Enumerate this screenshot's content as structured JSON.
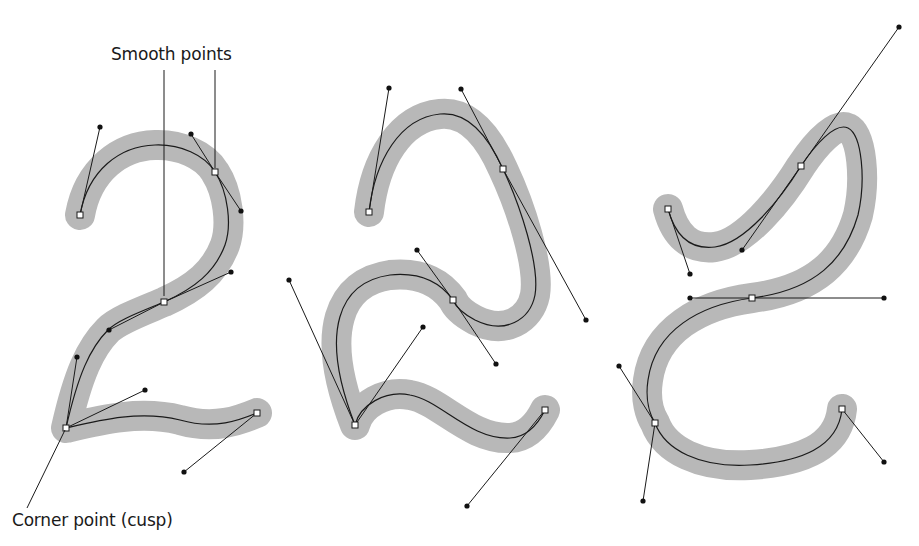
{
  "labels": {
    "smooth": {
      "text": "Smooth points",
      "x": 111,
      "y": 44
    },
    "corner": {
      "text": "Corner point (cusp)",
      "x": 12,
      "y": 510
    }
  },
  "colors": {
    "stroke_band": "#b8b8b8",
    "path": "#1a1a1a",
    "handle": "#111111",
    "anchor_fill": "#ffffff"
  },
  "stroke_band_width": 30,
  "callouts": [
    {
      "name": "smooth-callout-1",
      "x1": 164,
      "y1": 70,
      "x2": 164,
      "y2": 296
    },
    {
      "name": "smooth-callout-2",
      "x1": 215,
      "y1": 70,
      "x2": 215,
      "y2": 168
    },
    {
      "name": "corner-callout",
      "x1": 65,
      "y1": 430,
      "x2": 27,
      "y2": 508
    }
  ],
  "glyphs": [
    {
      "name": "glyph-2-left",
      "path": "M 80 215 C 88 170, 120 146, 155 145 C 180 144, 205 155, 215 172 C 228 192, 232 225, 225 245 C 215 272, 195 288, 164 302 C 140 312, 118 320, 108 330 C 90 348, 78 375, 66 428 C 100 420, 140 410, 180 420 C 215 430, 240 420, 257 413",
      "anchors": [
        {
          "x": 80,
          "y": 215
        },
        {
          "x": 215,
          "y": 172
        },
        {
          "x": 164,
          "y": 302
        },
        {
          "x": 66,
          "y": 428
        },
        {
          "x": 257,
          "y": 413
        }
      ],
      "handles": [
        {
          "ax": 80,
          "ay": 215,
          "hx": 100,
          "hy": 127
        },
        {
          "ax": 215,
          "ay": 172,
          "hx": 191,
          "hy": 134
        },
        {
          "ax": 215,
          "ay": 172,
          "hx": 241,
          "hy": 211
        },
        {
          "ax": 164,
          "ay": 302,
          "hx": 231,
          "hy": 272
        },
        {
          "ax": 164,
          "ay": 302,
          "hx": 109,
          "hy": 330
        },
        {
          "ax": 66,
          "ay": 428,
          "hx": 77,
          "hy": 357
        },
        {
          "ax": 66,
          "ay": 428,
          "hx": 145,
          "hy": 390
        },
        {
          "ax": 257,
          "ay": 413,
          "hx": 184,
          "hy": 472
        }
      ]
    },
    {
      "name": "glyph-2-middle",
      "path": "M 369 212 C 375 160, 400 118, 440 114 C 470 111, 490 140, 503 169 C 520 205, 540 265, 535 295 C 530 320, 505 335, 475 320 C 460 312, 455 305, 453 300 C 440 282, 420 272, 390 275 C 340 282, 318 330, 355 425 C 360 405, 385 390, 410 395 C 440 400, 470 440, 510 438 C 530 437, 540 420, 545 410",
      "anchors": [
        {
          "x": 369,
          "y": 212
        },
        {
          "x": 503,
          "y": 169
        },
        {
          "x": 453,
          "y": 300
        },
        {
          "x": 355,
          "y": 425
        },
        {
          "x": 545,
          "y": 410
        }
      ],
      "handles": [
        {
          "ax": 369,
          "ay": 212,
          "hx": 389,
          "hy": 88
        },
        {
          "ax": 503,
          "ay": 169,
          "hx": 461,
          "hy": 89
        },
        {
          "ax": 503,
          "ay": 169,
          "hx": 586,
          "hy": 320
        },
        {
          "ax": 453,
          "ay": 300,
          "hx": 417,
          "hy": 250
        },
        {
          "ax": 453,
          "ay": 300,
          "hx": 496,
          "hy": 364
        },
        {
          "ax": 355,
          "ay": 425,
          "hx": 289,
          "hy": 280
        },
        {
          "ax": 355,
          "ay": 425,
          "hx": 423,
          "hy": 327
        },
        {
          "ax": 545,
          "ay": 410,
          "hx": 467,
          "hy": 506
        }
      ]
    },
    {
      "name": "glyph-2-right",
      "path": "M 668 209 C 675 235, 690 250, 715 247 C 745 243, 780 200, 801 166 C 815 145, 835 122, 848 128 C 862 135, 866 180, 858 215 C 845 260, 815 290, 752 298 C 700 305, 655 330, 648 380 C 645 400, 650 415, 655 423 C 665 450, 700 468, 750 465 C 800 462, 838 448, 842 409",
      "anchors": [
        {
          "x": 668,
          "y": 209
        },
        {
          "x": 801,
          "y": 166
        },
        {
          "x": 752,
          "y": 298
        },
        {
          "x": 655,
          "y": 423
        },
        {
          "x": 842,
          "y": 409
        }
      ],
      "handles": [
        {
          "ax": 668,
          "ay": 209,
          "hx": 690,
          "hy": 274
        },
        {
          "ax": 801,
          "ay": 166,
          "hx": 899,
          "hy": 27
        },
        {
          "ax": 801,
          "ay": 166,
          "hx": 742,
          "hy": 250
        },
        {
          "ax": 752,
          "ay": 298,
          "hx": 690,
          "hy": 298
        },
        {
          "ax": 752,
          "ay": 298,
          "hx": 884,
          "hy": 298
        },
        {
          "ax": 655,
          "ay": 423,
          "hx": 619,
          "hy": 366
        },
        {
          "ax": 655,
          "ay": 423,
          "hx": 643,
          "hy": 501
        },
        {
          "ax": 842,
          "ay": 409,
          "hx": 884,
          "hy": 462
        }
      ]
    }
  ]
}
